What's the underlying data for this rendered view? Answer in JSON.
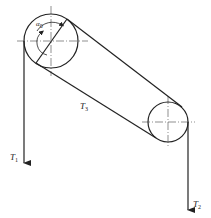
{
  "diagram": {
    "type": "belt-pulley free body diagram",
    "labels": {
      "tension_1": "T",
      "tension_1_sub": "1",
      "tension_2": "T",
      "tension_2_sub": "2",
      "tension_3": "T",
      "tension_3_sub": "3",
      "angle": "α",
      "angle_sub": "0"
    },
    "colors": {
      "stroke": "#222222",
      "centerline": "#444444"
    }
  }
}
